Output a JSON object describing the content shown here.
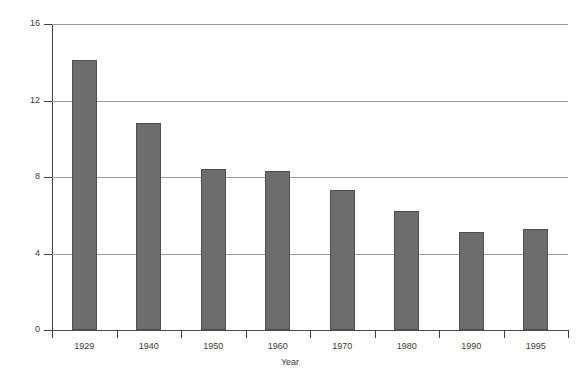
{
  "chart_data": {
    "type": "bar",
    "title": "",
    "xlabel": "Year",
    "ylabel": "Percent",
    "categories": [
      "1929",
      "1940",
      "1950",
      "1960",
      "1970",
      "1980",
      "1990",
      "1995"
    ],
    "values": [
      14.1,
      10.8,
      8.4,
      8.3,
      7.3,
      6.2,
      5.1,
      5.3
    ],
    "ylim": [
      0,
      16
    ],
    "yticks": [
      0,
      4,
      8,
      12,
      16
    ],
    "ytick_labels": [
      "0",
      "4",
      "8",
      "12",
      "16"
    ],
    "grid": "horizontal",
    "legend": "none",
    "series": [
      {
        "name": "Percent",
        "values": [
          14.1,
          10.8,
          8.4,
          8.3,
          7.3,
          6.2,
          5.1,
          5.3
        ]
      }
    ],
    "bar_color": "#6d6d6d",
    "bar_edge_color": "#4f4f4f",
    "grid_color": "#9a9a9a",
    "axis_color": "#3d3d3d",
    "background_color": "#ffffff"
  }
}
